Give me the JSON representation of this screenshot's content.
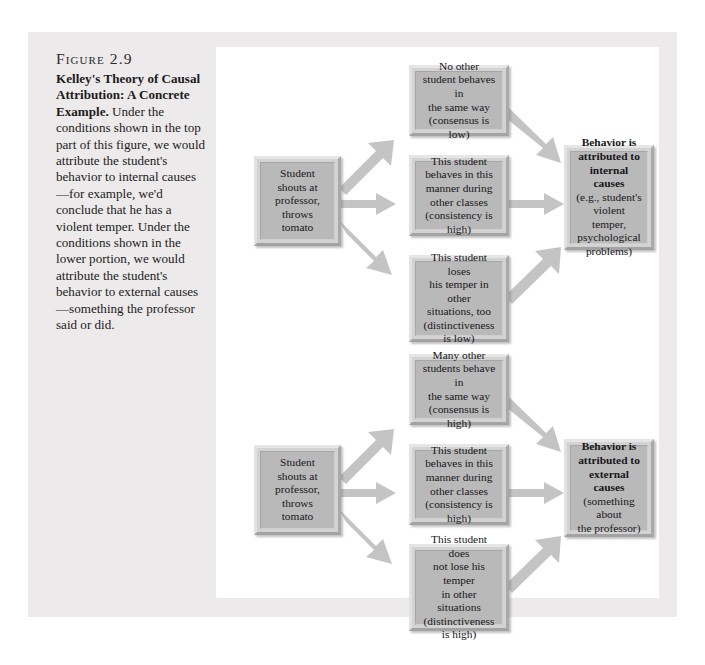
{
  "figure": {
    "number": "Figure 2.9",
    "caption_lead": "Kelley's Theory of Causal Attribution: A Concrete Example.",
    "caption_body": " Under the conditions shown in the top part of this figure, we would attribute the student's behavior to internal causes—for example, we'd conclude that he has a violent temper. Under the conditions shown in the lower portion, we would attribute the student's behavior to external causes—something the professor said or did."
  },
  "colors": {
    "page_background": "#ffffff",
    "panel_background": "#eceaea",
    "diagram_background": "#ffffff",
    "box_fill": "#b9b9b9",
    "box_bevel_light": "#e3e3e3",
    "box_bevel_dark": "#a6a6a6",
    "arrow_fill": "#c4c4c4",
    "text": "#17171a"
  },
  "diagram": {
    "top": {
      "cause": {
        "lines": [
          "Student shouts at",
          "professor, throws",
          "tomato"
        ]
      },
      "conditions": [
        {
          "lines": [
            "No other",
            "student behaves in",
            "the same way",
            "(consensus is low)"
          ]
        },
        {
          "lines": [
            "This student",
            "behaves in this",
            "manner during",
            "other classes",
            "(consistency is high)"
          ]
        },
        {
          "lines": [
            "This student loses",
            "his temper in other",
            "situations, too",
            "(distinctiveness",
            "is low)"
          ]
        }
      ],
      "outcome": {
        "bold_lines": [
          "Behavior is",
          "attributed to",
          "internal causes"
        ],
        "plain_lines": [
          "(e.g., student's",
          "violent temper,",
          "psychological",
          "problems)"
        ]
      }
    },
    "bottom": {
      "cause": {
        "lines": [
          "Student shouts at",
          "professor, throws",
          "tomato"
        ]
      },
      "conditions": [
        {
          "lines": [
            "Many other",
            "students behave in",
            "the same way",
            "(consensus is high)"
          ]
        },
        {
          "lines": [
            "This student",
            "behaves in this",
            "manner during",
            "other classes",
            "(consistency is high)"
          ]
        },
        {
          "lines": [
            "This student does",
            "not lose his temper",
            "in other situations",
            "(distinctiveness",
            "is high)"
          ]
        }
      ],
      "outcome": {
        "bold_lines": [
          "Behavior is",
          "attributed to",
          "external causes"
        ],
        "plain_lines": [
          "(something about",
          "the professor)"
        ]
      }
    }
  }
}
